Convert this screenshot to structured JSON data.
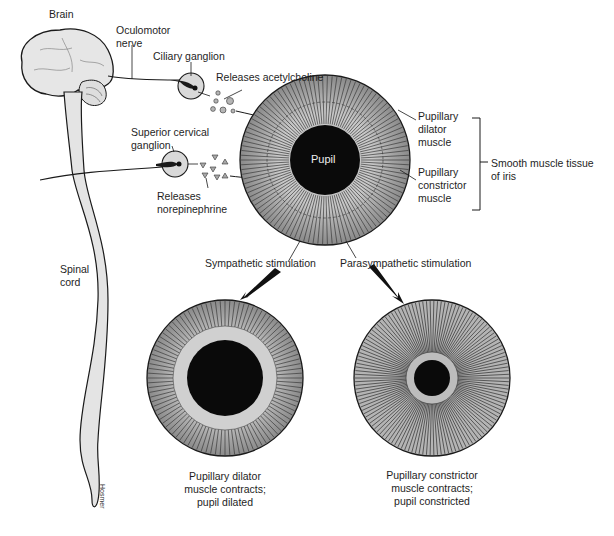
{
  "figure": {
    "labels": {
      "brain": "Brain",
      "oculomotor_nerve": [
        "Oculomotor",
        "nerve"
      ],
      "ciliary_ganglion": "Ciliary ganglion",
      "releases_ach": "Releases acetylcholine",
      "superior_cervical_ganglion": [
        "Superior cervical",
        "ganglion"
      ],
      "releases_ne": [
        "Releases",
        "norepinephrine"
      ],
      "pupil": "Pupil",
      "dilator_muscle": [
        "Pupillary",
        "dilator",
        "muscle"
      ],
      "constrictor_muscle": [
        "Pupillary",
        "constrictor",
        "muscle"
      ],
      "smooth_muscle": [
        "Smooth muscle tissue",
        "of iris"
      ],
      "spinal_cord": [
        "Spinal",
        "cord"
      ],
      "sympathetic": "Sympathetic stimulation",
      "parasympathetic": "Parasympathetic stimulation",
      "dilated_caption": [
        "Pupillary dilator",
        "muscle contracts;",
        "pupil dilated"
      ],
      "constricted_caption": [
        "Pupillary constrictor",
        "muscle contracts;",
        "pupil constricted"
      ],
      "artist_signature": "Hosmer"
    },
    "colors": {
      "ink": "#1a1a1a",
      "iris_fill": "#9a9a9a",
      "iris_light": "#d6d6d6",
      "pupil": "#0a0a0a",
      "tissue": "#e3e3e3"
    }
  }
}
